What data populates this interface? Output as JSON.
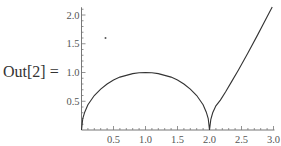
{
  "cell": {
    "output_label": "Out[2] ="
  },
  "chart_data": {
    "type": "line",
    "title": "",
    "xlabel": "",
    "ylabel": "",
    "xlim": [
      0,
      3.0
    ],
    "ylim": [
      0,
      2.1
    ],
    "grid": false,
    "legend": null,
    "x_ticks": [
      "0.5",
      "1.0",
      "1.5",
      "2.0",
      "2.5",
      "3.0"
    ],
    "y_ticks": [
      "0.5",
      "1.0",
      "1.5",
      "2.0"
    ],
    "x_tick_values": [
      0.5,
      1.0,
      1.5,
      2.0,
      2.5,
      3.0
    ],
    "y_tick_values": [
      0.5,
      1.0,
      1.5,
      2.0
    ],
    "series": [
      {
        "name": "curve",
        "color": "#333333",
        "x": [
          0,
          0.02,
          0.05,
          0.1,
          0.2,
          0.3,
          0.4,
          0.5,
          0.6,
          0.7,
          0.8,
          0.9,
          1.0,
          1.1,
          1.2,
          1.3,
          1.4,
          1.5,
          1.6,
          1.7,
          1.8,
          1.9,
          1.95,
          1.98,
          2.0,
          2.02,
          2.05,
          2.1,
          2.17,
          2.25,
          2.35,
          2.45,
          2.6,
          2.75,
          2.9,
          2.98
        ],
        "y": [
          0,
          0.2,
          0.31,
          0.44,
          0.6,
          0.71,
          0.8,
          0.87,
          0.92,
          0.95,
          0.98,
          0.995,
          1.0,
          0.995,
          0.98,
          0.95,
          0.92,
          0.87,
          0.8,
          0.71,
          0.6,
          0.44,
          0.31,
          0.2,
          0,
          0.18,
          0.3,
          0.42,
          0.52,
          0.66,
          0.85,
          1.04,
          1.34,
          1.65,
          1.97,
          2.14
        ]
      }
    ],
    "annotations": [
      {
        "type": "point",
        "x": 0.375,
        "y": 1.6
      }
    ]
  }
}
